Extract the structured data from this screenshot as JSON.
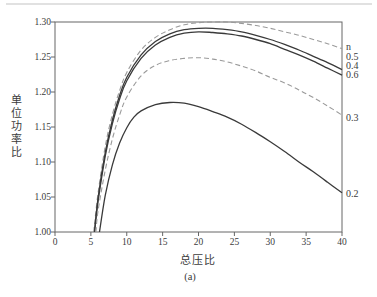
{
  "figure": {
    "caption": "(a)",
    "background": "#ffffff"
  },
  "chart_data": {
    "type": "line",
    "title": "",
    "xlabel": "总压比",
    "ylabel": "单位功率比",
    "xlim": [
      0,
      40
    ],
    "ylim": [
      1.0,
      1.3
    ],
    "x_ticks": [
      "0",
      "5",
      "10",
      "15",
      "20",
      "25",
      "30",
      "35",
      "40"
    ],
    "y_ticks": [
      "1.00",
      "1.05",
      "1.10",
      "1.15",
      "1.20",
      "1.25",
      "1.30"
    ],
    "grid": false,
    "legend_title": "n",
    "legend_position": "right-outside",
    "colors": {
      "solid_line": "#3a3a3a",
      "dashed_line": "#9a9a9a",
      "axis": "#666666"
    },
    "series": [
      {
        "name": "n-0.5",
        "label": "0.5",
        "style": "dashed",
        "points": [
          [
            5.4,
            1.0
          ],
          [
            6,
            1.055
          ],
          [
            7,
            1.122
          ],
          [
            8,
            1.168
          ],
          [
            9,
            1.202
          ],
          [
            10,
            1.228
          ],
          [
            12,
            1.26
          ],
          [
            14,
            1.278
          ],
          [
            16,
            1.289
          ],
          [
            18,
            1.296
          ],
          [
            20,
            1.299
          ],
          [
            22,
            1.3
          ],
          [
            24,
            1.3
          ],
          [
            26,
            1.298
          ],
          [
            28,
            1.295
          ],
          [
            30,
            1.291
          ],
          [
            32,
            1.286
          ],
          [
            34,
            1.281
          ],
          [
            36,
            1.275
          ],
          [
            38,
            1.269
          ],
          [
            40,
            1.262
          ]
        ]
      },
      {
        "name": "n-0.4",
        "label": "0.4",
        "style": "solid",
        "points": [
          [
            5.5,
            1.0
          ],
          [
            6,
            1.048
          ],
          [
            7,
            1.113
          ],
          [
            8,
            1.16
          ],
          [
            9,
            1.195
          ],
          [
            10,
            1.221
          ],
          [
            12,
            1.253
          ],
          [
            14,
            1.272
          ],
          [
            16,
            1.283
          ],
          [
            18,
            1.289
          ],
          [
            20,
            1.291
          ],
          [
            22,
            1.291
          ],
          [
            24,
            1.289
          ],
          [
            26,
            1.286
          ],
          [
            28,
            1.281
          ],
          [
            30,
            1.275
          ],
          [
            32,
            1.268
          ],
          [
            34,
            1.26
          ],
          [
            36,
            1.251
          ],
          [
            38,
            1.242
          ],
          [
            40,
            1.232
          ]
        ]
      },
      {
        "name": "n-0.6",
        "label": "0.6",
        "style": "solid",
        "points": [
          [
            5.5,
            1.0
          ],
          [
            6,
            1.043
          ],
          [
            7,
            1.108
          ],
          [
            8,
            1.155
          ],
          [
            9,
            1.19
          ],
          [
            10,
            1.216
          ],
          [
            12,
            1.248
          ],
          [
            14,
            1.267
          ],
          [
            16,
            1.278
          ],
          [
            18,
            1.284
          ],
          [
            20,
            1.286
          ],
          [
            22,
            1.285
          ],
          [
            24,
            1.283
          ],
          [
            26,
            1.28
          ],
          [
            28,
            1.275
          ],
          [
            30,
            1.269
          ],
          [
            32,
            1.261
          ],
          [
            34,
            1.253
          ],
          [
            36,
            1.244
          ],
          [
            38,
            1.234
          ],
          [
            40,
            1.224
          ]
        ]
      },
      {
        "name": "n-0.3",
        "label": "0.3",
        "style": "dashed",
        "points": [
          [
            5.7,
            1.0
          ],
          [
            6,
            1.03
          ],
          [
            7,
            1.088
          ],
          [
            8,
            1.133
          ],
          [
            9,
            1.167
          ],
          [
            10,
            1.193
          ],
          [
            12,
            1.223
          ],
          [
            14,
            1.238
          ],
          [
            16,
            1.245
          ],
          [
            18,
            1.248
          ],
          [
            20,
            1.249
          ],
          [
            22,
            1.247
          ],
          [
            24,
            1.243
          ],
          [
            26,
            1.237
          ],
          [
            28,
            1.23
          ],
          [
            30,
            1.221
          ],
          [
            32,
            1.213
          ],
          [
            34,
            1.203
          ],
          [
            36,
            1.192
          ],
          [
            38,
            1.18
          ],
          [
            40,
            1.167
          ]
        ]
      },
      {
        "name": "n-0.2",
        "label": "0.2",
        "style": "solid",
        "points": [
          [
            6.2,
            1.0
          ],
          [
            7,
            1.052
          ],
          [
            8,
            1.096
          ],
          [
            9,
            1.127
          ],
          [
            10,
            1.149
          ],
          [
            11,
            1.164
          ],
          [
            12,
            1.173
          ],
          [
            14,
            1.182
          ],
          [
            16,
            1.185
          ],
          [
            18,
            1.184
          ],
          [
            20,
            1.179
          ],
          [
            22,
            1.172
          ],
          [
            24,
            1.164
          ],
          [
            26,
            1.154
          ],
          [
            28,
            1.142
          ],
          [
            30,
            1.129
          ],
          [
            32,
            1.115
          ],
          [
            34,
            1.1
          ],
          [
            36,
            1.086
          ],
          [
            38,
            1.071
          ],
          [
            40,
            1.056
          ]
        ]
      }
    ]
  }
}
